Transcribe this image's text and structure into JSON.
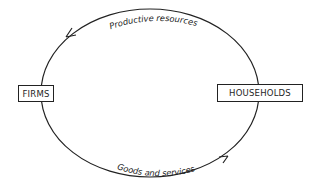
{
  "diagram": {
    "type": "circular-flow",
    "nodes": [
      {
        "id": "firms",
        "label": "FIRMS"
      },
      {
        "id": "households",
        "label": "HOUSEHOLDS"
      }
    ],
    "flows": [
      {
        "from": "households",
        "to": "firms",
        "label": "Productive resources",
        "path": "top"
      },
      {
        "from": "firms",
        "to": "households",
        "label": "Goods and services",
        "path": "bottom"
      }
    ],
    "colors": {
      "line": "#222222",
      "background": "#ffffff"
    }
  }
}
